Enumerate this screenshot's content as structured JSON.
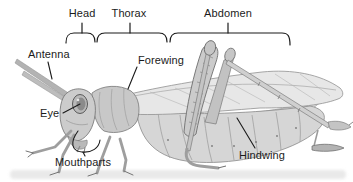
{
  "diagram": {
    "region_labels": {
      "head": "Head",
      "thorax": "Thorax",
      "abdomen": "Abdomen"
    },
    "part_labels": {
      "antenna": "Antenna",
      "eye": "Eye",
      "mouthparts": "Mouthparts",
      "forewing": "Forewing",
      "hindwing": "Hindwing"
    },
    "colors": {
      "background": "#ffffff",
      "label_text": "#1b1b1b",
      "annotation_line": "#1b1b1b",
      "illustration_gray": "#c9c9c9"
    }
  }
}
